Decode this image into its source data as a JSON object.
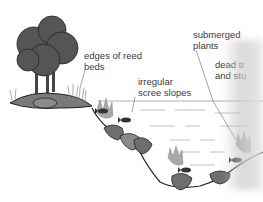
{
  "diagram": {
    "labels": [
      {
        "id": "reed-beds",
        "line1": "edges of reed",
        "line2": "beds"
      },
      {
        "id": "scree",
        "line1": "irregular",
        "line2": "scree slopes"
      },
      {
        "id": "submerged",
        "line1": "submerged",
        "line2": "plants"
      },
      {
        "id": "dead-trees",
        "line1": "dead tr",
        "line2": "and stu"
      }
    ],
    "colors": {
      "tree": "#555555",
      "rock": "#6e6e6e",
      "rock_light": "#8a8a8a",
      "plants": "#a8a8a8",
      "outline": "#222222",
      "water_lines": "#9a9a9a"
    }
  }
}
